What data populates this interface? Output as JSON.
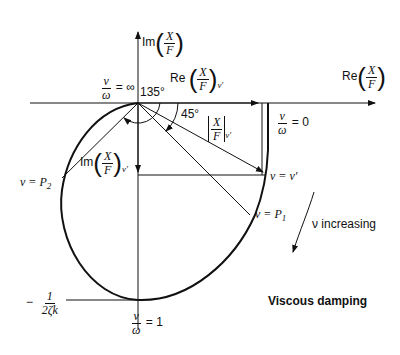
{
  "diagram": {
    "title": "Viscous damping",
    "axes": {
      "vertical_label_prefix": "Im",
      "horizontal_label_prefix": "Re",
      "frac_num": "X",
      "frac_den": "F"
    },
    "labels": {
      "nu": "ν",
      "omega": "ω",
      "eq_inf": "= ∞",
      "eq_zero": "= 0",
      "eq_one": "= 1",
      "angle_135": "135°",
      "angle_45": "45°",
      "re_at_nuprime_prefix": "Re",
      "im_at_nuprime_prefix": "Im",
      "sub_nuprime": "ν′",
      "nu_eq_nuprime": "ν = ν′",
      "nu_eq_p1": "ν = P",
      "p1_sub": "1",
      "nu_eq_p2": "ν = P",
      "p2_sub": "2",
      "nu_increasing": "ν increasing",
      "minus": "−",
      "one": "1",
      "two_zeta_k": "2ζk"
    },
    "colors": {
      "ink": "#111111",
      "background": "#ffffff"
    }
  }
}
